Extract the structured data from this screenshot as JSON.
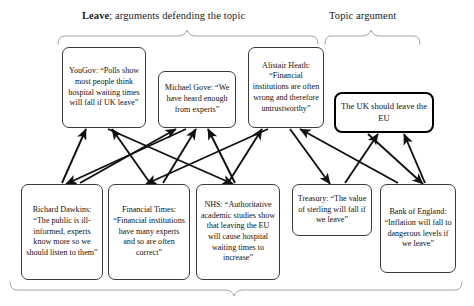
{
  "diagram": {
    "braces": [
      {
        "name": "leave-brace",
        "label_bold": "Leave",
        "label_rest": "; arguments defending the topic"
      },
      {
        "name": "topic-brace",
        "label_bold": "",
        "label_rest": "Topic argument"
      },
      {
        "name": "bottom-brace",
        "label_bold": "",
        "label_rest": ""
      }
    ],
    "top_nodes": [
      {
        "id": "yougov",
        "text": "YouGov: “Polls show most people think hospital waiting times will fall if UK leave”"
      },
      {
        "id": "gove",
        "text": "Michael Gove: “We have heard enough from experts”"
      },
      {
        "id": "heath",
        "text": "Alistair Heath: “Financial institutions are often wrong and therefore untrustworthy”"
      }
    ],
    "topic_node": {
      "id": "topic",
      "text": "The UK should leave the EU"
    },
    "bottom_nodes": [
      {
        "id": "dawkins",
        "text": "Richard Dawkins: “The public is ill-informed, experts know more so we should listen to them”"
      },
      {
        "id": "ft",
        "text": "Financial Times: “Financial institutions have many experts and so are often correct”"
      },
      {
        "id": "nhs",
        "text": "NHS: “Authoritative academic studies show that leaving the EU will cause hospital waiting times to increase”"
      },
      {
        "id": "treasury",
        "text": "Treasury: “The value of sterling will fall if we leave”"
      },
      {
        "id": "boe",
        "text": "Bank of England: “Inflation will fall to dangerous levels if we leave”"
      }
    ],
    "edges": [
      {
        "from": "dawkins",
        "to": "yougov"
      },
      {
        "from": "ft",
        "to": "yougov"
      },
      {
        "from": "yougov",
        "to": "nhs"
      },
      {
        "from": "dawkins",
        "to": "gove"
      },
      {
        "from": "ft",
        "to": "gove"
      },
      {
        "from": "nhs",
        "to": "gove"
      },
      {
        "from": "gove",
        "to": "dawkins"
      },
      {
        "from": "heath",
        "to": "ft"
      },
      {
        "from": "nhs",
        "to": "heath"
      },
      {
        "from": "boe",
        "to": "heath"
      },
      {
        "from": "heath",
        "to": "treasury"
      },
      {
        "from": "treasury",
        "to": "topic"
      },
      {
        "from": "boe",
        "to": "topic"
      },
      {
        "from": "topic",
        "to": "boe"
      }
    ]
  }
}
